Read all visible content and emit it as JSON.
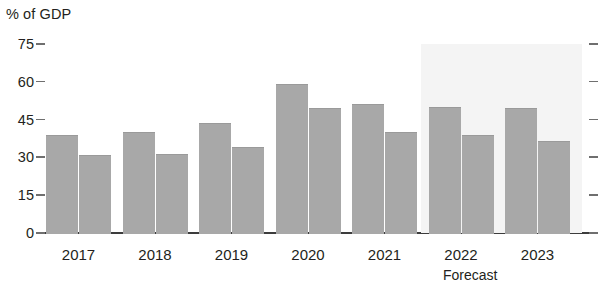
{
  "chart_data": {
    "type": "bar",
    "title": "",
    "ylabel": "% of GDP",
    "xlabel": "",
    "grid": false,
    "legend": "none",
    "ylim": [
      0,
      75
    ],
    "yticks": [
      0,
      15,
      30,
      45,
      60,
      75
    ],
    "ytick_labels": [
      "0",
      "15",
      "30",
      "45",
      "60",
      "75"
    ],
    "categories": [
      "2017",
      "2018",
      "2019",
      "2020",
      "2021",
      "2022",
      "2023"
    ],
    "series": [
      {
        "name": "series-1",
        "values": [
          39,
          40,
          43.5,
          59,
          51,
          50,
          49.5
        ],
        "color": "#a8a8a8"
      },
      {
        "name": "series-2",
        "values": [
          31,
          31.5,
          34,
          49.5,
          40,
          39,
          36.5
        ],
        "color": "#a8a8a8"
      }
    ],
    "annotations": [
      {
        "name": "forecast-label",
        "text": "Forecast",
        "applies_to": [
          "2022",
          "2023"
        ]
      }
    ],
    "forecast_region": {
      "start_category": "2022",
      "end_category": "2023",
      "shade_color": "#f4f4f4"
    }
  },
  "axis": {
    "y_title": "% of GDP"
  }
}
